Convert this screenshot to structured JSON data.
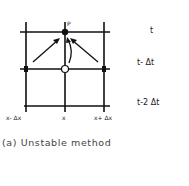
{
  "diagram": {
    "point_label": "P",
    "time_labels": [
      "t",
      "t- Δt",
      "t-2 Δt"
    ],
    "space_labels": [
      "x- Δx",
      "x",
      "x+ Δx"
    ],
    "caption": "(a) Unstable method"
  }
}
